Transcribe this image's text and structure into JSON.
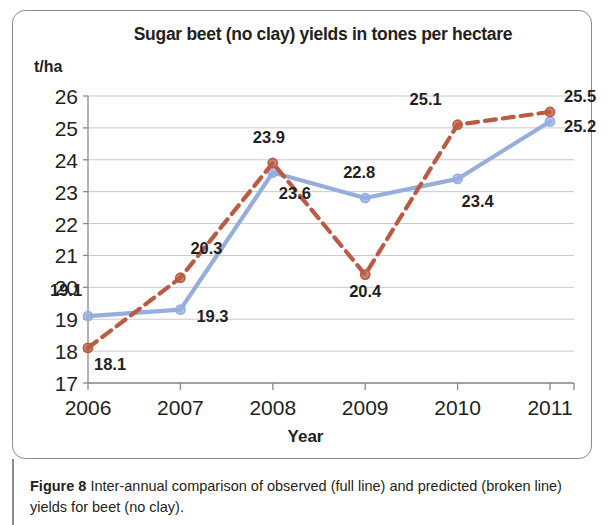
{
  "figure": {
    "caption_label": "Figure 8",
    "caption_text": " Inter-annual comparison of observed (full line) and predicted (broken line) yields for beet (no clay)."
  },
  "chart_data": {
    "type": "line",
    "title": "Sugar beet (no clay) yields in tones per hectare",
    "xlabel": "Year",
    "ylabel": "t/ha",
    "categories": [
      "2006",
      "2007",
      "2008",
      "2009",
      "2010",
      "2011"
    ],
    "ylim": [
      17,
      26
    ],
    "yticks": [
      "17",
      "18",
      "19",
      "20",
      "21",
      "22",
      "23",
      "24",
      "25",
      "26"
    ],
    "grid": true,
    "legend": "none",
    "series": [
      {
        "name": "observed (full line)",
        "style": "solid",
        "color": "#95AEDC",
        "values": [
          19.1,
          19.3,
          23.6,
          22.8,
          23.4,
          25.2
        ],
        "labels": [
          "19.1",
          "19.3",
          "23.6",
          "22.8",
          "23.4",
          "25.2"
        ]
      },
      {
        "name": "predicted (broken line)",
        "style": "dashed",
        "color": "#BC5B43",
        "values": [
          18.1,
          20.3,
          23.9,
          20.4,
          25.1,
          25.5
        ],
        "labels": [
          "18.1",
          "20.3",
          "23.9",
          "20.4",
          "25.1",
          "25.5"
        ]
      }
    ]
  }
}
